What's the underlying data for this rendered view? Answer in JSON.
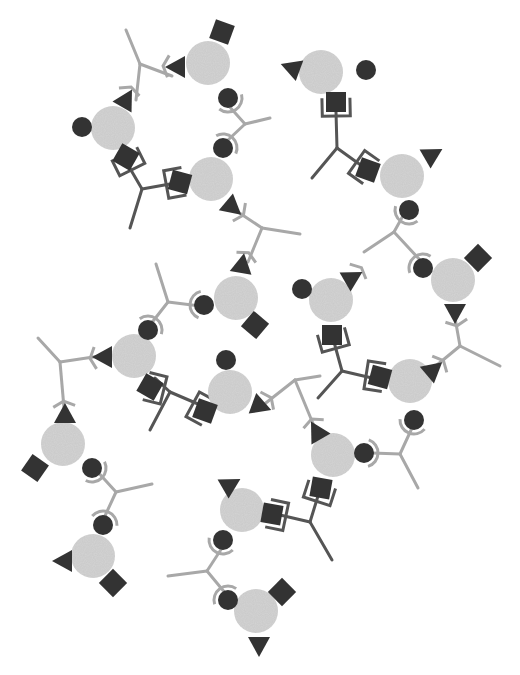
{
  "diagram": {
    "title": "",
    "colors": {
      "background": "#ffffff",
      "node_core": "#d4d4d4",
      "site": "#333333",
      "light_linker": "#a8a8a8",
      "dark_linker": "#555555"
    },
    "node_radius": 22,
    "nodes": [
      {
        "id": "n1",
        "cx": 208,
        "cy": 63,
        "square": [
          222,
          32,
          20
        ],
        "triangle": [
          177,
          67,
          180
        ],
        "circle": [
          228,
          98
        ]
      },
      {
        "id": "n2",
        "cx": 113,
        "cy": 128,
        "circle": [
          82,
          127
        ],
        "triangle": [
          126,
          100,
          -60
        ],
        "square": [
          126,
          157,
          30
        ]
      },
      {
        "id": "n3",
        "cx": 211,
        "cy": 179,
        "circle": [
          223,
          148
        ],
        "square": [
          180,
          182,
          15
        ],
        "triangle": [
          232,
          207,
          40
        ]
      },
      {
        "id": "n4",
        "cx": 236,
        "cy": 298,
        "triangle": [
          242,
          265,
          -80
        ],
        "circle": [
          204,
          305
        ],
        "square": [
          255,
          325,
          40
        ]
      },
      {
        "id": "n5",
        "cx": 134,
        "cy": 356,
        "circle": [
          148,
          330
        ],
        "triangle": [
          104,
          357,
          180
        ],
        "square": [
          150,
          387,
          30
        ]
      },
      {
        "id": "n6",
        "cx": 230,
        "cy": 392,
        "circle": [
          226,
          360
        ],
        "triangle": [
          260,
          406,
          20
        ],
        "square": [
          205,
          411,
          20
        ]
      },
      {
        "id": "n7",
        "cx": 333,
        "cy": 455,
        "triangle": [
          317,
          432,
          -120
        ],
        "circle": [
          364,
          453
        ],
        "square": [
          321,
          488,
          10
        ]
      },
      {
        "id": "n8",
        "cx": 410,
        "cy": 381,
        "triangle": [
          433,
          370,
          -40
        ],
        "square": [
          380,
          377,
          15
        ],
        "circle": [
          414,
          420
        ]
      },
      {
        "id": "n9",
        "cx": 453,
        "cy": 280,
        "square": [
          478,
          258,
          45
        ],
        "circle": [
          423,
          268
        ],
        "triangle": [
          455,
          312,
          90
        ]
      },
      {
        "id": "n10",
        "cx": 331,
        "cy": 300,
        "circle": [
          302,
          289
        ],
        "triangle": [
          352,
          278,
          -30
        ],
        "square": [
          332,
          335,
          0
        ]
      },
      {
        "id": "n11",
        "cx": 63,
        "cy": 444,
        "triangle": [
          65,
          415,
          -90
        ],
        "square": [
          35,
          468,
          35
        ],
        "circle": [
          92,
          468
        ]
      },
      {
        "id": "n12",
        "cx": 93,
        "cy": 556,
        "circle": [
          103,
          525
        ],
        "triangle": [
          64,
          561,
          180
        ],
        "square": [
          113,
          583,
          45
        ]
      },
      {
        "id": "n13",
        "cx": 242,
        "cy": 510,
        "triangle": [
          230,
          485,
          -30
        ],
        "square": [
          272,
          514,
          10
        ],
        "circle": [
          223,
          540
        ]
      },
      {
        "id": "n14",
        "cx": 256,
        "cy": 611,
        "circle": [
          228,
          600
        ],
        "square": [
          282,
          592,
          45
        ],
        "triangle": [
          259,
          645,
          90
        ]
      },
      {
        "id": "n15",
        "cx": 321,
        "cy": 72,
        "triangle": [
          292,
          68,
          200
        ],
        "circle": [
          366,
          70
        ],
        "square": [
          336,
          102,
          0
        ]
      },
      {
        "id": "n16",
        "cx": 402,
        "cy": 176,
        "triangle": [
          432,
          155,
          -30
        ],
        "square": [
          368,
          170,
          20
        ],
        "circle": [
          409,
          210
        ]
      }
    ],
    "linkers": [
      {
        "id": "L1",
        "type": "light",
        "hub": [
          140,
          64
        ],
        "arms": [
          [
            126,
            30
          ],
          [
            172,
            76
          ],
          [
            136,
            100
          ]
        ]
      },
      {
        "id": "L2",
        "type": "light",
        "hub": [
          245,
          124
        ],
        "arms": [
          [
            228,
            105
          ],
          [
            270,
            118
          ],
          [
            228,
            140
          ]
        ]
      },
      {
        "id": "L3",
        "type": "dark",
        "hub": [
          142,
          189
        ],
        "arms": [
          [
            128,
            165
          ],
          [
            170,
            184
          ],
          [
            130,
            228
          ]
        ]
      },
      {
        "id": "L4",
        "type": "light",
        "hub": [
          262,
          228
        ],
        "arms": [
          [
            238,
            212
          ],
          [
            300,
            234
          ],
          [
            248,
            262
          ]
        ]
      },
      {
        "id": "L5",
        "type": "light",
        "hub": [
          168,
          302
        ],
        "arms": [
          [
            156,
            264
          ],
          [
            200,
            306
          ],
          [
            150,
            325
          ]
        ]
      },
      {
        "id": "L6",
        "type": "dark",
        "hub": [
          170,
          392
        ],
        "arms": [
          [
            155,
            378
          ],
          [
            198,
            404
          ],
          [
            150,
            430
          ]
        ]
      },
      {
        "id": "L7",
        "type": "light",
        "hub": [
          60,
          362
        ],
        "arms": [
          [
            38,
            338
          ],
          [
            100,
            356
          ],
          [
            64,
            408
          ]
        ]
      },
      {
        "id": "L8",
        "type": "light",
        "hub": [
          116,
          492
        ],
        "arms": [
          [
            96,
            470
          ],
          [
            152,
            484
          ],
          [
            104,
            518
          ]
        ]
      },
      {
        "id": "L9",
        "type": "light",
        "hub": [
          295,
          380
        ],
        "arms": [
          [
            262,
            406
          ],
          [
            320,
            376
          ],
          [
            314,
            426
          ]
        ]
      },
      {
        "id": "L10",
        "type": "dark",
        "hub": [
          342,
          371
        ],
        "arms": [
          [
            334,
            342
          ],
          [
            372,
            378
          ],
          [
            318,
            398
          ]
        ]
      },
      {
        "id": "L11",
        "type": "light",
        "hub": [
          460,
          346
        ],
        "arms": [
          [
            455,
            318
          ],
          [
            426,
            374
          ],
          [
            500,
            366
          ]
        ]
      },
      {
        "id": "L12",
        "type": "light",
        "hub": [
          394,
          232
        ],
        "arms": [
          [
            404,
            214
          ],
          [
            364,
            252
          ],
          [
            420,
            260
          ]
        ]
      },
      {
        "id": "L13",
        "type": "light",
        "hub": [
          400,
          454
        ],
        "arms": [
          [
            372,
            453
          ],
          [
            412,
            428
          ],
          [
            418,
            488
          ]
        ]
      },
      {
        "id": "L14",
        "type": "dark",
        "hub": [
          310,
          522
        ],
        "arms": [
          [
            318,
            496
          ],
          [
            280,
            515
          ],
          [
            332,
            560
          ]
        ]
      },
      {
        "id": "L15",
        "type": "light",
        "hub": [
          207,
          571
        ],
        "arms": [
          [
            222,
            548
          ],
          [
            168,
            576
          ],
          [
            226,
            594
          ]
        ]
      },
      {
        "id": "L16",
        "type": "dark",
        "hub": [
          337,
          148
        ],
        "arms": [
          [
            336,
            112
          ],
          [
            362,
            166
          ],
          [
            312,
            178
          ]
        ]
      }
    ]
  }
}
